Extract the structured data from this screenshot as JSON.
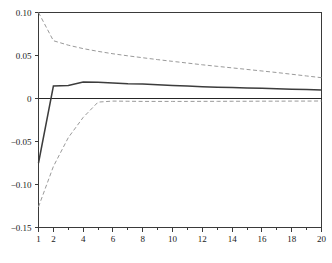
{
  "chart_data": {
    "type": "line",
    "title": "",
    "subtitle": "",
    "xlabel": "",
    "ylabel": "",
    "xlim": [
      1,
      20
    ],
    "ylim": [
      -0.15,
      0.1
    ],
    "grid": false,
    "legend": "none",
    "y_ticks": [
      0.1,
      0.05,
      0,
      -0.05,
      -0.1,
      -0.15
    ],
    "y_tick_labels": [
      "0.10",
      "0.05",
      "0",
      "−0.05",
      "−0.10",
      "−0.15"
    ],
    "x_ticks": [
      1,
      2,
      3,
      4,
      5,
      6,
      7,
      8,
      9,
      10,
      11,
      12,
      13,
      14,
      15,
      16,
      17,
      18,
      19,
      20
    ],
    "x_tick_labels_shown": [
      "1",
      "2",
      "4",
      "6",
      "8",
      "10",
      "12",
      "14",
      "16",
      "18",
      "20"
    ],
    "x_labeled_ticks": [
      1,
      2,
      4,
      6,
      8,
      10,
      12,
      14,
      16,
      18,
      20
    ],
    "zero_reference_line": 0,
    "x": [
      1,
      2,
      3,
      4,
      5,
      6,
      7,
      8,
      9,
      10,
      11,
      12,
      13,
      14,
      15,
      16,
      17,
      18,
      19,
      20
    ],
    "series": [
      {
        "name": "point-estimate",
        "style": "solid",
        "color": "#3c3c3c",
        "values": [
          -0.075,
          0.0145,
          0.015,
          0.0192,
          0.0188,
          0.018,
          0.0172,
          0.0168,
          0.016,
          0.0152,
          0.0145,
          0.0138,
          0.0132,
          0.0128,
          0.0122,
          0.0118,
          0.0112,
          0.0108,
          0.0104,
          0.01
        ]
      },
      {
        "name": "upper-confidence-band",
        "style": "dashed",
        "color": "#9a9a9a",
        "values": [
          0.118,
          0.0672,
          0.062,
          0.058,
          0.0548,
          0.052,
          0.0496,
          0.0474,
          0.0452,
          0.0432,
          0.0412,
          0.0392,
          0.0374,
          0.0356,
          0.0338,
          0.032,
          0.0302,
          0.0282,
          0.0262,
          0.0242
        ]
      },
      {
        "name": "lower-confidence-band",
        "style": "dashed",
        "color": "#9a9a9a",
        "values": [
          -0.126,
          -0.079,
          -0.0455,
          -0.022,
          -0.0042,
          -0.003,
          -0.0032,
          -0.0034,
          -0.0034,
          -0.0034,
          -0.0034,
          -0.0033,
          -0.0033,
          -0.0032,
          -0.0032,
          -0.0031,
          -0.0031,
          -0.003,
          -0.003,
          -0.0029
        ]
      }
    ]
  }
}
